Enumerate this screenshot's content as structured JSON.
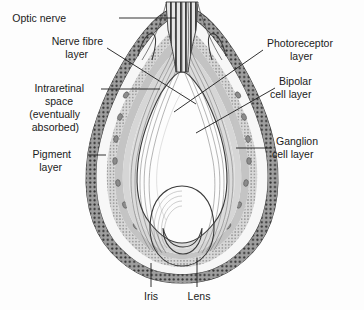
{
  "figure": {
    "background_color": "#fdfdfd"
  },
  "colors": {
    "vitreous": "#a9a9a9",
    "vitreous_dark": "#9a9a9a",
    "lens_body": "#b2b2b2",
    "lens_inner": "#a0a0a0",
    "sclera_light": "#ececec",
    "intraretinal_space": "#f4f4f4",
    "pigment_band": "#9e9e9e",
    "pigment_dot": "#2e2e2e",
    "photoreceptor_band": "#c9c9c9",
    "bipolar_band": "#bdbdbd",
    "ganglion_band": "#d4d4d4",
    "nerve_fibre_band": "#cfcfcf",
    "optic_nerve_stripe": "#3c3c3c",
    "outline": "#3a3a3a",
    "label_text": "#1b1b1b",
    "leader_line": "#1b1b1b"
  },
  "labels": {
    "optic_nerve": "Optic nerve",
    "nerve_fibre_line1": "Nerve fibre",
    "nerve_fibre_line2": "layer",
    "intraretinal_line1": "Intraretinal",
    "intraretinal_line2": "space",
    "intraretinal_line3": "(eventually",
    "intraretinal_line4": "absorbed)",
    "pigment_line1": "Pigment",
    "pigment_line2": "layer",
    "photoreceptor_line1": "Photoreceptor",
    "photoreceptor_line2": "layer",
    "bipolar_line1": "Bipolar",
    "bipolar_line2": "cell layer",
    "ganglion_line1": "Ganglion",
    "ganglion_line2": "cell layer",
    "iris": "Iris",
    "lens": "Lens"
  },
  "structures": [
    {
      "name": "optic-nerve",
      "side": "top-center"
    },
    {
      "name": "nerve-fibre-layer",
      "side": "left"
    },
    {
      "name": "intraretinal-space",
      "side": "left"
    },
    {
      "name": "pigment-layer",
      "side": "left"
    },
    {
      "name": "photoreceptor-layer",
      "side": "right"
    },
    {
      "name": "bipolar-cell-layer",
      "side": "right"
    },
    {
      "name": "ganglion-cell-layer",
      "side": "right"
    },
    {
      "name": "iris",
      "side": "bottom-left"
    },
    {
      "name": "lens",
      "side": "bottom-center"
    }
  ]
}
